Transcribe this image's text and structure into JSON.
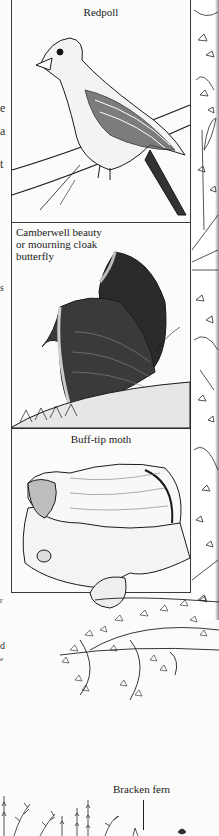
{
  "page": {
    "type": "scanned book page",
    "background": "#fbfbfa",
    "ink": "#1c1c1c"
  },
  "panels": [
    {
      "caption": "Redpoll",
      "subject": "bird on birch branch"
    },
    {
      "caption_lines": [
        "Camberwell beauty",
        "or mourning cloak",
        "butterfly"
      ],
      "subject": "butterfly with folded wings on bark"
    },
    {
      "caption": "Buff-tip moth",
      "subject": "moth resting on broken twig"
    }
  ],
  "margin_fragments": {
    "left_column": [
      "e",
      "a",
      "t",
      "s",
      "r",
      "d",
      "e"
    ]
  },
  "bottom_label": {
    "text": "Bracken fern"
  },
  "decorative_border": {
    "description": "leafy branch pattern along right edge"
  }
}
